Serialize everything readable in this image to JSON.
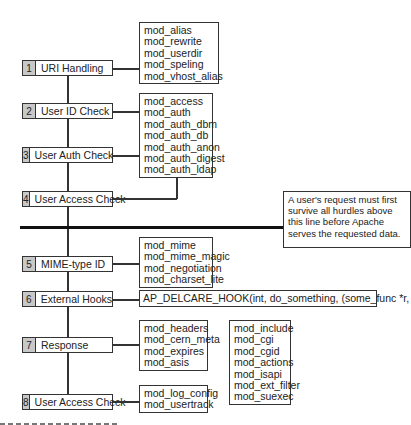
{
  "diagram": {
    "steps": [
      {
        "num": "1",
        "label": "URI Handling"
      },
      {
        "num": "2",
        "label": "User ID Check"
      },
      {
        "num": "3",
        "label": "User Auth Check"
      },
      {
        "num": "4",
        "label": "User Access Check"
      },
      {
        "num": "5",
        "label": "MIME-type ID"
      },
      {
        "num": "6",
        "label": "External Hooks"
      },
      {
        "num": "7",
        "label": "Response"
      },
      {
        "num": "8",
        "label": "User Access Check"
      }
    ],
    "module_groups": {
      "uri": [
        "mod_alias",
        "mod_rewrite",
        "mod_userdir",
        "mod_speling",
        "mod_vhost_alias"
      ],
      "auth": [
        "mod_access",
        "mod_auth",
        "mod_auth_dbm",
        "mod_auth_db",
        "mod_auth_anon",
        "mod_auth_digest",
        "mod_auth_ldap"
      ],
      "mime": [
        "mod_mime",
        "mod_mime_magic",
        "mod_negotiation",
        "mod_charset_lite"
      ],
      "response": [
        "mod_headers",
        "mod_cern_meta",
        "mod_expires",
        "mod_asis"
      ],
      "content": [
        "mod_include",
        "mod_cgi",
        "mod_cgid",
        "mod_actions",
        "mod_isapi",
        "mod_ext_filter",
        "mod_suexec"
      ],
      "logging": [
        "mod_log_config",
        "mod_usertrack"
      ]
    },
    "hook": "AP_DELCARE_HOOK(int, do_something, (some_func *r, int n))",
    "note": "A user's request must first survive all hurdles above this line before Apache serves the requested data."
  }
}
